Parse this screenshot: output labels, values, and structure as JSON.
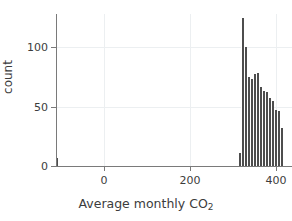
{
  "chart_data": {
    "type": "bar",
    "title": "",
    "subtitle": "",
    "xlabel": "Average monthly CO",
    "xlabel_sub": "2",
    "xlabel_full": "Average monthly CO2",
    "ylabel": "count",
    "xlim": [
      -130,
      430
    ],
    "ylim": [
      0,
      128
    ],
    "grid": true,
    "legend": null,
    "bar_color": "#4d4d4d",
    "grid_color": "#eceff1",
    "axis_color": "#7a7a7a",
    "xticks": [
      0,
      200,
      400
    ],
    "xtick_labels": [
      "0",
      "200",
      "400"
    ],
    "yticks": [
      0,
      50,
      100
    ],
    "ytick_labels": [
      "0",
      "50",
      "100"
    ],
    "bin_width": 7,
    "bins": [
      {
        "x": -113,
        "value": 7
      },
      {
        "x": 311,
        "value": 11
      },
      {
        "x": 318,
        "value": 124
      },
      {
        "x": 325,
        "value": 100
      },
      {
        "x": 332,
        "value": 75
      },
      {
        "x": 339,
        "value": 73
      },
      {
        "x": 346,
        "value": 77
      },
      {
        "x": 353,
        "value": 78
      },
      {
        "x": 360,
        "value": 66
      },
      {
        "x": 367,
        "value": 63
      },
      {
        "x": 374,
        "value": 62
      },
      {
        "x": 381,
        "value": 57
      },
      {
        "x": 388,
        "value": 55
      },
      {
        "x": 395,
        "value": 47
      },
      {
        "x": 402,
        "value": 46
      },
      {
        "x": 409,
        "value": 32
      }
    ]
  }
}
